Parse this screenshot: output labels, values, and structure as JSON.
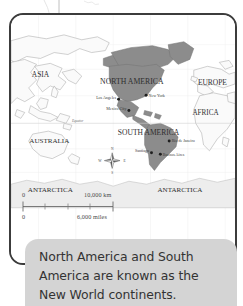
{
  "map": {
    "title": "world-map",
    "continents": [
      {
        "name": "ASIA",
        "x": 30,
        "y": 63,
        "size": 7.6,
        "highlight": false
      },
      {
        "name": "NORTH AMERICA",
        "x": 123,
        "y": 70,
        "size": 7.9,
        "highlight": true
      },
      {
        "name": "EUROPE",
        "x": 205,
        "y": 71,
        "size": 7.6,
        "highlight": false
      },
      {
        "name": "AFRICA",
        "x": 198,
        "y": 102,
        "size": 7.3,
        "highlight": false
      },
      {
        "name": "SOUTH AMERICA",
        "x": 140,
        "y": 122,
        "size": 7.7,
        "highlight": true
      },
      {
        "name": "AUSTRALIA",
        "x": 39,
        "y": 130,
        "size": 7.2,
        "highlight": false
      },
      {
        "name": "ANTARCTICA",
        "x": 40,
        "y": 180,
        "size": 7.2,
        "highlight": false
      },
      {
        "name": "ANTARCTICA",
        "x": 172,
        "y": 180,
        "size": 7.2,
        "highlight": false
      }
    ],
    "cities": [
      {
        "name": "Los Angeles",
        "dot_x": 109.5,
        "dot_y": 85.5,
        "label_x": 107,
        "label_y": 85.0,
        "anchor": "end"
      },
      {
        "name": "New York",
        "dot_x": 137.5,
        "dot_y": 81.5,
        "label_x": 140,
        "label_y": 83.0,
        "anchor": "start"
      },
      {
        "name": "Mexico City",
        "dot_x": 120.0,
        "dot_y": 97.0,
        "label_x": 117.5,
        "label_y": 96.5,
        "anchor": "end"
      },
      {
        "name": "Rio de Janeiro",
        "dot_x": 161.0,
        "dot_y": 128.0,
        "label_x": 163.5,
        "label_y": 129.5,
        "anchor": "start"
      },
      {
        "name": "Santiago",
        "dot_x": 143.0,
        "dot_y": 140.0,
        "label_x": 140.5,
        "label_y": 139.5,
        "anchor": "end"
      },
      {
        "name": "Buenos Aires",
        "dot_x": 152.0,
        "dot_y": 141.5,
        "label_x": 154.5,
        "label_y": 143.5,
        "anchor": "start"
      }
    ],
    "equator_label": "Equator",
    "compass": {
      "north": "N",
      "south": "S",
      "east": "E",
      "west": "W"
    },
    "colors": {
      "highlight_fill": "#8c8c8c",
      "land_fill": "#fafafa",
      "land_stroke": "#a9a9a9",
      "ocean_fill": "#ffffff",
      "antarctica_fill": "#ededed",
      "frame_stroke": "#3c3c3c"
    }
  },
  "scale_bar": {
    "km_zero": "0",
    "km_max": "10,000 km",
    "miles_zero": "0",
    "miles_max": "6,000 miles"
  },
  "caption": {
    "text": "North America and South America are known as the New World continents."
  }
}
